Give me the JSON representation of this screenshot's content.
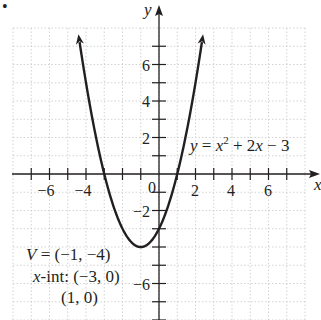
{
  "bullet": "•",
  "chart_data": {
    "type": "line",
    "title": "",
    "equation": "y = x² + 2x − 3",
    "function": "x^2 + 2x - 3",
    "xlabel": "x",
    "ylabel": "y",
    "xlim": [
      -8,
      8
    ],
    "ylim": [
      -8,
      8
    ],
    "grid": true,
    "x_ticks": [
      -6,
      -4,
      2,
      4,
      6
    ],
    "y_ticks": [
      6,
      4,
      2,
      -2,
      -6
    ],
    "origin_label": "0",
    "series": [
      {
        "name": "y = x^2 + 2x - 3",
        "x": [
          -4.4,
          -4,
          -3,
          -2,
          -1,
          0,
          1,
          2,
          2.4
        ],
        "y": [
          7.56,
          5,
          0,
          -3,
          -4,
          -3,
          0,
          5,
          7.56
        ]
      }
    ],
    "annotations": {
      "vertex": "V = (−1, −4)",
      "x_intercepts_label": "x-int: (−3, 0)",
      "x_intercept_2": "(1, 0)"
    }
  },
  "labels": {
    "x_axis": "x",
    "y_axis": "y",
    "origin": "0",
    "xt": [
      "−6",
      "−4",
      "2",
      "4",
      "6"
    ],
    "yt": [
      "6",
      "4",
      "2",
      "−2",
      "−6"
    ],
    "eq_y": "y",
    "eq_eq": " = ",
    "eq_x": "x",
    "eq_sup": "2",
    "eq_rest": " + 2",
    "eq_x2": "x",
    "eq_end": " − 3",
    "v_label": "V",
    "v_value": " = (−1, −4)",
    "xint_x": "x",
    "xint_rest": "-int: (−3, 0)",
    "xint_2": "(1, 0)"
  }
}
